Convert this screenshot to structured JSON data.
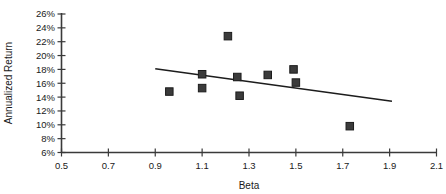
{
  "chart_data": {
    "type": "scatter",
    "title": "",
    "xlabel": "Beta",
    "ylabel": "Annualized Return",
    "xlim": [
      0.5,
      2.1
    ],
    "ylim": [
      6,
      26
    ],
    "xticks": [
      0.5,
      0.7,
      0.9,
      1.1,
      1.3,
      1.5,
      1.7,
      1.9,
      2.1
    ],
    "xtick_labels": [
      "0.5",
      "0.7",
      "0.9",
      "1.1",
      "1.3",
      "1.5",
      "1.7",
      "1.9",
      "2.1"
    ],
    "yticks": [
      6,
      8,
      10,
      12,
      14,
      16,
      18,
      20,
      22,
      24,
      26
    ],
    "ytick_labels": [
      "6%",
      "8%",
      "10%",
      "12%",
      "14%",
      "16%",
      "18%",
      "20%",
      "22%",
      "24%",
      "26%"
    ],
    "grid": false,
    "legend": null,
    "marker_shape": "square",
    "marker_color": "#3b3b3b",
    "points": [
      {
        "x": 0.96,
        "y": 14.8
      },
      {
        "x": 1.1,
        "y": 17.3
      },
      {
        "x": 1.1,
        "y": 15.3
      },
      {
        "x": 1.21,
        "y": 22.8
      },
      {
        "x": 1.25,
        "y": 16.9
      },
      {
        "x": 1.26,
        "y": 14.2
      },
      {
        "x": 1.38,
        "y": 17.2
      },
      {
        "x": 1.49,
        "y": 18.0
      },
      {
        "x": 1.5,
        "y": 16.1
      },
      {
        "x": 1.73,
        "y": 9.8
      }
    ],
    "trendline": {
      "type": "linear",
      "x_start": 0.9,
      "y_start": 18.1,
      "x_end": 1.91,
      "y_end": 13.4,
      "color": "#1c1c1c"
    }
  },
  "axes": {
    "x_axis_name": "Beta",
    "y_axis_name": "Annualized Return"
  }
}
